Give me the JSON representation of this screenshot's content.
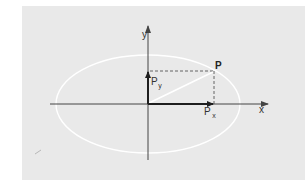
{
  "diagram": {
    "type": "ellipse-vector-decomposition",
    "colors": {
      "background": "#ffffff",
      "panel": "#e9e9e9",
      "axis": "#444444",
      "components": "#1e1e1e",
      "ellipse": "#ffffff",
      "dashed": "#555555"
    },
    "labels": {
      "y_axis": "y",
      "x_axis": "x",
      "point": "P",
      "px_main": "P",
      "px_sub": "x",
      "py_main": "P",
      "py_sub": "y"
    },
    "elements": [
      {
        "name": "x-axis",
        "description": "horizontal axis with arrow pointing right"
      },
      {
        "name": "y-axis",
        "description": "vertical axis with arrow pointing up"
      },
      {
        "name": "ellipse",
        "description": "white ellipse centered at origin"
      },
      {
        "name": "position-vector",
        "description": "white line from origin to point P on ellipse"
      },
      {
        "name": "px-component",
        "description": "bold arrow along x-axis to Px"
      },
      {
        "name": "py-component",
        "description": "bold arrow along y-axis to Py"
      },
      {
        "name": "projection-lines",
        "description": "dashed lines from P to both axes"
      }
    ]
  }
}
